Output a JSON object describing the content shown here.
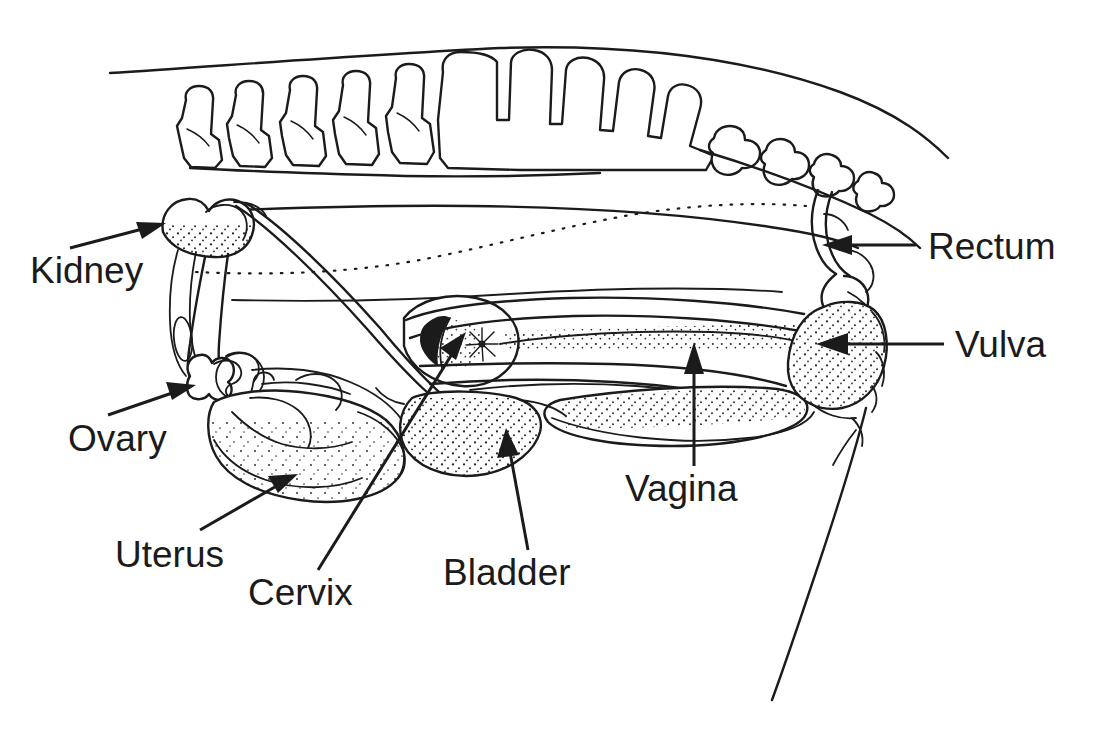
{
  "diagram": {
    "view": "lateral sagittal section",
    "background_color": "#ffffff",
    "line_color": "#1b1b1b",
    "text_color": "#1b1b1b"
  },
  "labels": [
    {
      "id": "kidney",
      "text": "Kidney",
      "x": 30,
      "y": 252,
      "anchor": "start",
      "leader": "arrow",
      "points_to": "kidney-organ"
    },
    {
      "id": "rectum",
      "text": "Rectum",
      "x": 928,
      "y": 228,
      "anchor": "start",
      "leader": "arrow",
      "points_to": "rectum-organ"
    },
    {
      "id": "vulva",
      "text": "Vulva",
      "x": 955,
      "y": 326,
      "anchor": "start",
      "leader": "arrow",
      "points_to": "vulva-organ"
    },
    {
      "id": "ovary",
      "text": "Ovary",
      "x": 68,
      "y": 420,
      "anchor": "start",
      "leader": "arrow",
      "points_to": "ovary-organ"
    },
    {
      "id": "vagina",
      "text": "Vagina",
      "x": 625,
      "y": 470,
      "anchor": "start",
      "leader": "arrow",
      "points_to": "vagina-organ"
    },
    {
      "id": "uterus",
      "text": "Uterus",
      "x": 115,
      "y": 536,
      "anchor": "start",
      "leader": "arrow",
      "points_to": "uterus-organ"
    },
    {
      "id": "bladder",
      "text": "Bladder",
      "x": 443,
      "y": 554,
      "anchor": "start",
      "leader": "arrow",
      "points_to": "bladder-organ"
    },
    {
      "id": "cervix",
      "text": "Cervix",
      "x": 248,
      "y": 574,
      "anchor": "start",
      "leader": "arrow",
      "points_to": "cervix-organ"
    }
  ],
  "structures": [
    {
      "id": "lumbar-vertebrae",
      "name": "lumbar vertebrae",
      "count": 5
    },
    {
      "id": "sacrum",
      "name": "sacrum",
      "count": 1
    },
    {
      "id": "caudal-vertebrae",
      "name": "caudal vertebrae",
      "count": 4
    },
    {
      "id": "kidney-organ",
      "name": "kidney",
      "texture": "stippled"
    },
    {
      "id": "ureter",
      "name": "ureter",
      "texture": "tube"
    },
    {
      "id": "ovary-organ",
      "name": "ovary",
      "texture": "outline"
    },
    {
      "id": "oviduct",
      "name": "oviduct",
      "texture": "convoluted"
    },
    {
      "id": "uterus-organ",
      "name": "uterine horns",
      "texture": "stippled"
    },
    {
      "id": "cervix-organ",
      "name": "cervix",
      "texture": "rosette"
    },
    {
      "id": "vagina-organ",
      "name": "vagina",
      "texture": "stippled"
    },
    {
      "id": "bladder-organ",
      "name": "urinary bladder",
      "texture": "stippled"
    },
    {
      "id": "rectum-organ",
      "name": "rectum",
      "texture": "outline"
    },
    {
      "id": "vulva-organ",
      "name": "vulva",
      "texture": "stippled"
    },
    {
      "id": "body-outline",
      "name": "body wall outline",
      "texture": "line"
    },
    {
      "id": "hind-leg",
      "name": "hind limb contour",
      "texture": "line"
    }
  ]
}
